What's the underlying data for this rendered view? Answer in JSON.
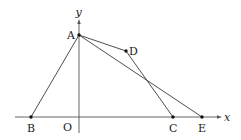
{
  "diagram": {
    "axes": {
      "x_label": "x",
      "y_label": "y",
      "origin_label": "O"
    },
    "points": [
      {
        "id": "A",
        "label": "A"
      },
      {
        "id": "B",
        "label": "B"
      },
      {
        "id": "C",
        "label": "C"
      },
      {
        "id": "D",
        "label": "D"
      },
      {
        "id": "E",
        "label": "E"
      }
    ],
    "segments": [
      [
        "A",
        "B"
      ],
      [
        "A",
        "D"
      ],
      [
        "D",
        "C"
      ],
      [
        "A",
        "E"
      ]
    ],
    "colors": {
      "stroke": "#3a3a3a",
      "point": "#111111",
      "text": "#222222"
    }
  }
}
